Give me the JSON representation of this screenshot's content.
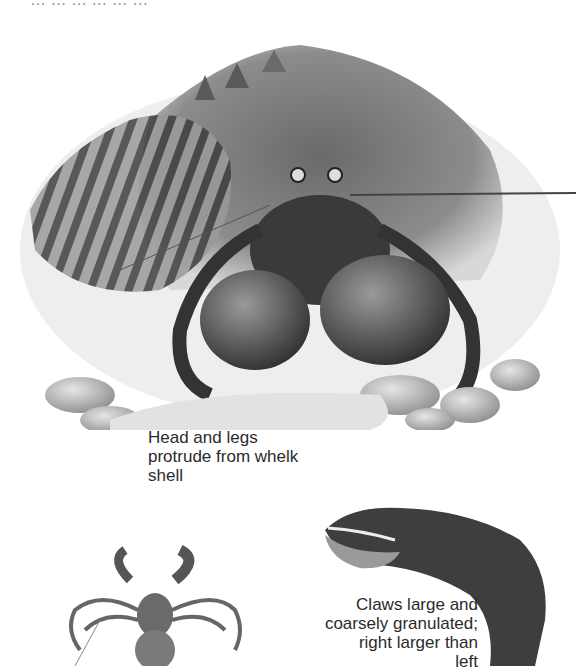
{
  "page": {
    "cropped_top_text": "… … … … … …"
  },
  "illustrations": {
    "main": {
      "subject": "hermit crab in whelk shell among pebbles"
    },
    "dorsal": {
      "subject": "hermit crab dorsal view"
    },
    "claw": {
      "subject": "large granulated claw"
    }
  },
  "captions": {
    "main": {
      "lines": [
        "Head and legs",
        "protrude from whelk",
        "shell"
      ]
    },
    "claw": {
      "lines": [
        "Claws large and",
        "coarsely granulated;",
        "right larger than",
        "left"
      ]
    }
  },
  "colors": {
    "background": "#ffffff",
    "ink": "#2b2b2b",
    "shell_dark": "#4a4a4a",
    "shell_mid": "#7a7a7a",
    "pebble": "#b9b9b9"
  }
}
